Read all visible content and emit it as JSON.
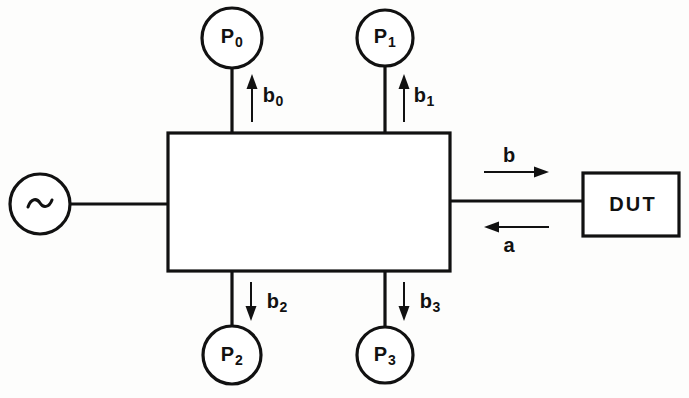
{
  "diagram": {
    "background_color": "#fdfdfc",
    "line_color": "#111111",
    "source": {
      "name": "signal-source",
      "symbol": "~",
      "shape": "circle",
      "cx": 40,
      "cy": 204,
      "r": 30
    },
    "junction": {
      "name": "six-port-junction",
      "label": "",
      "x": 168,
      "y": 133,
      "width": 282,
      "height": 138
    },
    "dut": {
      "name": "device-under-test",
      "label": "DUT",
      "x": 583,
      "y": 173,
      "width": 96,
      "height": 63
    },
    "detectors": [
      {
        "id": "P0",
        "base": "P",
        "sub": "0",
        "cx": 232,
        "cy": 38,
        "r": 30,
        "position": "top-left"
      },
      {
        "id": "P1",
        "base": "P",
        "sub": "1",
        "cx": 385,
        "cy": 38,
        "r": 28,
        "position": "top-right"
      },
      {
        "id": "P2",
        "base": "P",
        "sub": "2",
        "cx": 232,
        "cy": 355,
        "r": 29,
        "position": "bottom-left"
      },
      {
        "id": "P3",
        "base": "P",
        "sub": "3",
        "cx": 385,
        "cy": 355,
        "r": 28,
        "position": "bottom-right"
      }
    ],
    "wave_labels": [
      {
        "id": "b0",
        "base": "b",
        "sub": "0",
        "x": 273,
        "y": 97,
        "direction": "up"
      },
      {
        "id": "b1",
        "base": "b",
        "sub": "1",
        "x": 424,
        "y": 97,
        "direction": "up"
      },
      {
        "id": "b2",
        "base": "b",
        "sub": "2",
        "x": 277,
        "y": 303,
        "direction": "down"
      },
      {
        "id": "b3",
        "base": "b",
        "sub": "3",
        "x": 430,
        "y": 303,
        "direction": "down"
      },
      {
        "id": "b",
        "base": "b",
        "sub": "",
        "x": 509,
        "y": 155,
        "direction": "right"
      },
      {
        "id": "a",
        "base": "a",
        "sub": "",
        "x": 509,
        "y": 245,
        "direction": "left"
      }
    ]
  }
}
